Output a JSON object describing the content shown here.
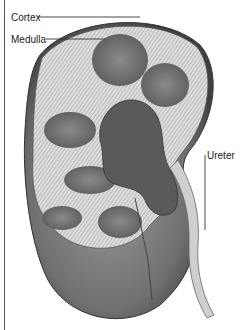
{
  "figure": {
    "labels": [
      {
        "id": "cortex",
        "text": "Cortex"
      },
      {
        "id": "medulla",
        "text": "Medulla"
      },
      {
        "id": "ureter",
        "text": "Ureter"
      }
    ]
  },
  "colors": {
    "background": "#ffffff",
    "label_text": "#222222",
    "leader_line": "#333333",
    "cortex": "#d9d9d9",
    "medulla": "#7a7a7a",
    "outer_surface": "#6e6e6e",
    "pelvis": "#4a4a4a"
  }
}
